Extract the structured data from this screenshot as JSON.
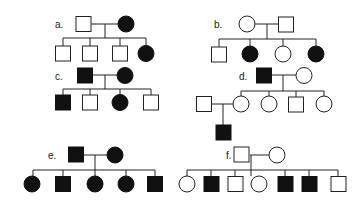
{
  "figure": {
    "colors": {
      "affected": "#111111",
      "unaffected": "#ffffff",
      "line": "#222222"
    }
  },
  "pedigrees": [
    {
      "label": "a.",
      "parents": [
        {
          "sex": "male",
          "affected": false
        },
        {
          "sex": "female",
          "affected": true
        }
      ],
      "children": [
        {
          "sex": "male",
          "affected": false
        },
        {
          "sex": "male",
          "affected": false
        },
        {
          "sex": "male",
          "affected": false
        },
        {
          "sex": "female",
          "affected": true
        }
      ]
    },
    {
      "label": "b.",
      "parents": [
        {
          "sex": "female",
          "affected": false
        },
        {
          "sex": "male",
          "affected": false
        }
      ],
      "children": [
        {
          "sex": "male",
          "affected": false
        },
        {
          "sex": "female",
          "affected": true
        },
        {
          "sex": "female",
          "affected": false
        },
        {
          "sex": "female",
          "affected": true
        }
      ]
    },
    {
      "label": "c.",
      "parents": [
        {
          "sex": "male",
          "affected": true
        },
        {
          "sex": "female",
          "affected": true
        }
      ],
      "children": [
        {
          "sex": "male",
          "affected": true
        },
        {
          "sex": "male",
          "affected": false
        },
        {
          "sex": "female",
          "affected": true
        },
        {
          "sex": "male",
          "affected": false
        }
      ]
    },
    {
      "label": "d.",
      "parents": [
        {
          "sex": "male",
          "affected": true
        },
        {
          "sex": "female",
          "affected": false
        }
      ],
      "children": [
        {
          "sex": "female",
          "affected": false,
          "spouse": {
            "sex": "male",
            "affected": false
          },
          "offspring": [
            {
              "sex": "male",
              "affected": true
            }
          ]
        },
        {
          "sex": "female",
          "affected": false
        },
        {
          "sex": "male",
          "affected": false
        },
        {
          "sex": "female",
          "affected": false
        }
      ]
    },
    {
      "label": "e.",
      "parents": [
        {
          "sex": "male",
          "affected": true
        },
        {
          "sex": "female",
          "affected": true
        }
      ],
      "children": [
        {
          "sex": "female",
          "affected": true
        },
        {
          "sex": "male",
          "affected": true
        },
        {
          "sex": "female",
          "affected": true
        },
        {
          "sex": "female",
          "affected": true
        },
        {
          "sex": "male",
          "affected": true
        }
      ]
    },
    {
      "label": "f.",
      "parents": [
        {
          "sex": "male",
          "affected": false
        },
        {
          "sex": "female",
          "affected": false
        }
      ],
      "children": [
        {
          "sex": "female",
          "affected": false
        },
        {
          "sex": "male",
          "affected": true
        },
        {
          "sex": "male",
          "affected": false
        },
        {
          "sex": "female",
          "affected": false
        },
        {
          "sex": "male",
          "affected": true
        },
        {
          "sex": "male",
          "affected": true
        },
        {
          "sex": "male",
          "affected": false
        }
      ]
    }
  ]
}
